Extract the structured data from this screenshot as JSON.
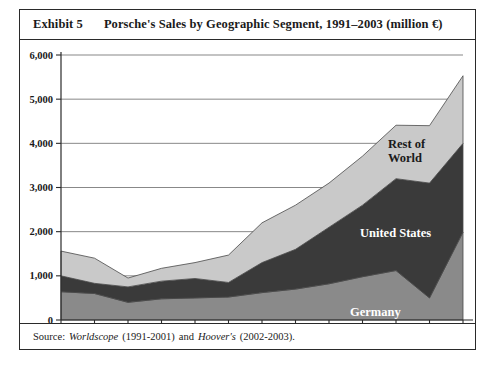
{
  "exhibit": {
    "number_label": "Exhibit 5",
    "title": "Porsche's Sales by Geographic Segment, 1991–2003 (million €)",
    "source_prefix": "Source:",
    "source_item1": "Worldscope",
    "source_range1": "(1991-2001)",
    "source_conjunction": "and",
    "source_item2": "Hoover's",
    "source_range2": "(2002-2003)."
  },
  "chart_data": {
    "type": "area",
    "stacked": true,
    "title": "Porsche's Sales by Geographic Segment, 1991–2003 (million €)",
    "xlabel": "",
    "ylabel": "",
    "ylim": [
      0,
      6000
    ],
    "yticks": [
      0,
      1000,
      2000,
      3000,
      4000,
      5000,
      6000
    ],
    "ytick_labels": [
      "0",
      "1,000",
      "2,000",
      "3,000",
      "4,000",
      "5,000",
      "6,000"
    ],
    "grid": true,
    "grid_axis": "y",
    "legend_position": "inline-annotations",
    "categories": [
      "1991",
      "1992",
      "1993",
      "1994",
      "1995",
      "1996",
      "1997",
      "1998",
      "1999",
      "2000",
      "2001",
      "2002",
      "2003"
    ],
    "series": [
      {
        "name": "Germany",
        "color": "#8a8a8a",
        "values": [
          640,
          600,
          400,
          480,
          500,
          520,
          620,
          700,
          820,
          980,
          1120,
          500,
          1990
        ]
      },
      {
        "name": "United States",
        "color": "#3a3a3a",
        "values": [
          360,
          230,
          350,
          400,
          440,
          330,
          680,
          900,
          1280,
          1620,
          2080,
          2600,
          2010
        ]
      },
      {
        "name": "Rest of World",
        "color": "#c9c9c9",
        "values": [
          560,
          570,
          200,
          290,
          360,
          620,
          900,
          1000,
          1000,
          1110,
          1210,
          1300,
          1530
        ]
      }
    ],
    "totals": [
      1560,
      1400,
      950,
      1170,
      1300,
      1470,
      2200,
      2600,
      3100,
      3710,
      4410,
      4400,
      5530
    ],
    "annotations": [
      {
        "text": "Rest of World",
        "series": "Rest of World",
        "x": "2001"
      },
      {
        "text": "United States",
        "series": "United States",
        "x": "2001"
      },
      {
        "text": "Germany",
        "series": "Germany",
        "x": "2000"
      }
    ]
  }
}
